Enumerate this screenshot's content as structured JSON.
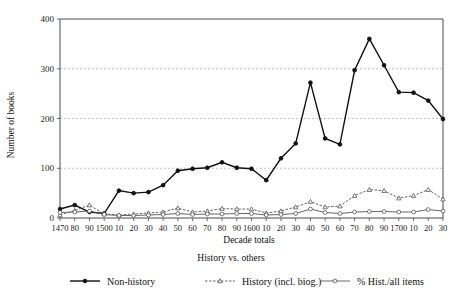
{
  "chart_data": {
    "type": "line",
    "title": "",
    "subtitle": "History vs. others",
    "xlabel": "Decade totals",
    "ylabel": "Number of books",
    "ylim": [
      0,
      400
    ],
    "yticks": [
      0,
      100,
      200,
      300,
      400
    ],
    "grid": true,
    "legend_position": "bottom",
    "categories": [
      "1470",
      "80",
      "90",
      "1500",
      "10",
      "20",
      "30",
      "40",
      "50",
      "60",
      "70",
      "80",
      "90",
      "1600",
      "10",
      "20",
      "30",
      "40",
      "50",
      "60",
      "70",
      "80",
      "90",
      "1700",
      "10",
      "20",
      "30"
    ],
    "series": [
      {
        "name": "Non-history",
        "marker": "filled-diamond",
        "line_style": "solid",
        "color": "#111111",
        "values": [
          18,
          26,
          12,
          9,
          55,
          50,
          52,
          66,
          95,
          99,
          101,
          112,
          101,
          99,
          76,
          120,
          150,
          272,
          160,
          148,
          297,
          360,
          307,
          253,
          252,
          236,
          199
        ]
      },
      {
        "name": "History (incl. biog.)",
        "marker": "open-triangle",
        "line_style": "dashed",
        "color": "#555555",
        "values": [
          6,
          15,
          26,
          8,
          6,
          8,
          10,
          12,
          20,
          12,
          14,
          19,
          18,
          18,
          10,
          14,
          22,
          33,
          22,
          24,
          45,
          57,
          55,
          40,
          45,
          57,
          38
        ]
      },
      {
        "name": "% Hist./all items",
        "marker": "open-circle",
        "line_style": "solid",
        "color": "#555555",
        "values": [
          11,
          12,
          14,
          7,
          5,
          5,
          6,
          7,
          9,
          7,
          8,
          8,
          9,
          9,
          6,
          7,
          9,
          18,
          11,
          9,
          12,
          13,
          13,
          12,
          12,
          17,
          14
        ]
      }
    ]
  },
  "legend": {
    "items": [
      {
        "label": "Non-history"
      },
      {
        "label": "History (incl. biog.)"
      },
      {
        "label": "% Hist./all items"
      }
    ]
  }
}
